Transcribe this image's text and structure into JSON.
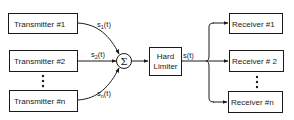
{
  "diagram": {
    "transmitters": [
      {
        "label": "Transmitter #1"
      },
      {
        "label": "Transmitter #2"
      },
      {
        "label": "Transmitter #n"
      }
    ],
    "ellipsis": "⋮",
    "signals_in": [
      {
        "base": "s",
        "sub": "1",
        "arg": "(t)"
      },
      {
        "base": "s",
        "sub": "2",
        "arg": "(t)"
      },
      {
        "base": "s",
        "sub": "n",
        "arg": "(t)"
      }
    ],
    "summer": {
      "symbol": "Σ"
    },
    "limiter": {
      "line1": "Hard",
      "line2": "Limiter"
    },
    "signal_out": {
      "base": "s",
      "arg": "(t)"
    },
    "receivers": [
      {
        "label": "Receiver #1"
      },
      {
        "label": "Receiver # 2"
      },
      {
        "label": "Receiver #n"
      }
    ],
    "colors": {
      "stroke": "#1a1a1a",
      "background": "#ffffff"
    }
  }
}
